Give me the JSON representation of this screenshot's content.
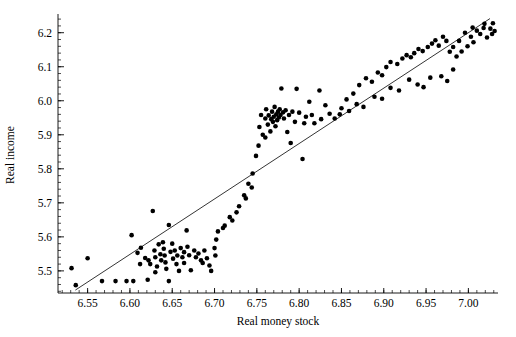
{
  "chart_data": {
    "type": "scatter",
    "title": "",
    "xlabel": "Real money stock",
    "ylabel": "Real income",
    "xlim": [
      6.515,
      7.035
    ],
    "ylim": [
      5.435,
      6.255
    ],
    "grid": false,
    "legend": null,
    "x_major_ticks": [
      6.55,
      6.6,
      6.65,
      6.7,
      6.75,
      6.8,
      6.85,
      6.9,
      6.95,
      7.0
    ],
    "x_major_tick_labels": [
      "6.55",
      "6.60",
      "6.65",
      "6.70",
      "6.75",
      "6.80",
      "6.85",
      "6.90",
      "6.95",
      "7.00"
    ],
    "x_minor_tick_step": 0.01,
    "y_major_ticks": [
      5.5,
      5.6,
      5.7,
      5.8,
      5.9,
      6.0,
      6.1,
      6.2
    ],
    "y_major_tick_labels": [
      "5.5",
      "5.6",
      "5.7",
      "5.8",
      "5.9",
      "6.0",
      "6.1",
      "6.2"
    ],
    "y_minor_tick_step": 0.02,
    "marker": "filled-circle",
    "marker_color": "#000000",
    "marker_size_px": 2.3,
    "series": [
      {
        "name": "observations",
        "points": [
          [
            6.531,
            5.508
          ],
          [
            6.536,
            5.458
          ],
          [
            6.55,
            5.537
          ],
          [
            6.567,
            5.47
          ],
          [
            6.602,
            5.605
          ],
          [
            6.604,
            5.47
          ],
          [
            6.609,
            5.553
          ],
          [
            6.612,
            5.52
          ],
          [
            6.621,
            5.474
          ],
          [
            6.622,
            5.531
          ],
          [
            6.624,
            5.52
          ],
          [
            6.627,
            5.676
          ],
          [
            6.629,
            5.56
          ],
          [
            6.63,
            5.54
          ],
          [
            6.632,
            5.513
          ],
          [
            6.634,
            5.578
          ],
          [
            6.636,
            5.549
          ],
          [
            6.637,
            5.531
          ],
          [
            6.639,
            5.584
          ],
          [
            6.64,
            5.565
          ],
          [
            6.641,
            5.545
          ],
          [
            6.642,
            5.525
          ],
          [
            6.643,
            5.506
          ],
          [
            6.646,
            5.635
          ],
          [
            6.648,
            5.556
          ],
          [
            6.65,
            5.58
          ],
          [
            6.651,
            5.536
          ],
          [
            6.653,
            5.56
          ],
          [
            6.655,
            5.52
          ],
          [
            6.656,
            5.545
          ],
          [
            6.658,
            5.5
          ],
          [
            6.66,
            5.567
          ],
          [
            6.662,
            5.54
          ],
          [
            6.664,
            5.555
          ],
          [
            6.667,
            5.619
          ],
          [
            6.668,
            5.571
          ],
          [
            6.67,
            5.546
          ],
          [
            6.672,
            5.502
          ],
          [
            6.676,
            5.56
          ],
          [
            6.678,
            5.54
          ],
          [
            6.681,
            5.551
          ],
          [
            6.684,
            5.531
          ],
          [
            6.688,
            5.56
          ],
          [
            6.691,
            5.537
          ],
          [
            6.696,
            5.5
          ],
          [
            6.7,
            5.567
          ],
          [
            6.701,
            5.545
          ],
          [
            6.704,
            5.616
          ],
          [
            6.712,
            5.633
          ],
          [
            6.721,
            5.648
          ],
          [
            6.729,
            5.69
          ],
          [
            6.737,
            5.713
          ],
          [
            6.744,
            5.745
          ],
          [
            6.749,
            5.838
          ],
          [
            6.753,
            5.923
          ],
          [
            6.755,
            5.958
          ],
          [
            6.757,
            5.9
          ],
          [
            6.76,
            5.948
          ],
          [
            6.761,
            5.975
          ],
          [
            6.763,
            5.93
          ],
          [
            6.764,
            5.957
          ],
          [
            6.766,
            5.91
          ],
          [
            6.767,
            5.946
          ],
          [
            6.768,
            5.968
          ],
          [
            6.769,
            5.938
          ],
          [
            6.77,
            5.953
          ],
          [
            6.771,
            5.982
          ],
          [
            6.772,
            5.925
          ],
          [
            6.773,
            5.96
          ],
          [
            6.774,
            5.943
          ],
          [
            6.775,
            5.968
          ],
          [
            6.776,
            5.951
          ],
          [
            6.777,
            5.975
          ],
          [
            6.778,
            5.958
          ],
          [
            6.779,
            6.036
          ],
          [
            6.781,
            5.966
          ],
          [
            6.782,
            5.948
          ],
          [
            6.784,
            5.972
          ],
          [
            6.786,
            5.908
          ],
          [
            6.788,
            5.958
          ],
          [
            6.79,
            5.876
          ],
          [
            6.792,
            5.968
          ],
          [
            6.795,
            5.938
          ],
          [
            6.797,
            6.035
          ],
          [
            6.8,
            5.965
          ],
          [
            6.804,
            5.829
          ],
          [
            6.808,
            5.953
          ],
          [
            6.812,
            5.997
          ],
          [
            6.818,
            5.934
          ],
          [
            6.824,
            6.03
          ],
          [
            6.831,
            5.987
          ],
          [
            6.842,
            5.948
          ],
          [
            6.848,
            5.96
          ],
          [
            6.856,
            6.004
          ],
          [
            6.864,
            6.021
          ],
          [
            6.871,
            6.046
          ],
          [
            6.879,
            6.066
          ],
          [
            6.886,
            6.056
          ],
          [
            6.893,
            6.083
          ],
          [
            6.898,
            6.075
          ],
          [
            6.903,
            6.099
          ],
          [
            6.908,
            6.114
          ],
          [
            6.916,
            6.108
          ],
          [
            6.922,
            6.124
          ],
          [
            6.927,
            6.134
          ],
          [
            6.932,
            6.128
          ],
          [
            6.936,
            6.14
          ],
          [
            6.941,
            6.152
          ],
          [
            6.946,
            6.146
          ],
          [
            6.952,
            6.158
          ],
          [
            6.957,
            6.168
          ],
          [
            6.961,
            6.178
          ],
          [
            6.965,
            6.162
          ],
          [
            6.97,
            6.188
          ],
          [
            6.974,
            6.176
          ],
          [
            6.978,
            6.144
          ],
          [
            6.982,
            6.158
          ],
          [
            6.986,
            6.13
          ],
          [
            6.989,
            6.176
          ],
          [
            6.992,
            6.145
          ],
          [
            6.996,
            6.2
          ],
          [
            6.999,
            6.16
          ],
          [
            7.003,
            6.188
          ],
          [
            7.006,
            6.172
          ],
          [
            7.01,
            6.206
          ],
          [
            7.014,
            6.196
          ],
          [
            7.018,
            6.214
          ],
          [
            7.022,
            6.186
          ],
          [
            7.026,
            6.212
          ],
          [
            7.029,
            6.228
          ],
          [
            6.982,
            6.092
          ],
          [
            6.975,
            6.058
          ],
          [
            6.968,
            6.072
          ],
          [
            6.955,
            6.068
          ],
          [
            6.947,
            6.04
          ],
          [
            6.94,
            6.048
          ],
          [
            6.93,
            6.062
          ],
          [
            6.918,
            6.03
          ],
          [
            6.908,
            6.038
          ],
          [
            6.898,
            6.006
          ],
          [
            6.889,
            6.012
          ],
          [
            6.876,
            5.982
          ],
          [
            6.868,
            5.99
          ],
          [
            6.859,
            5.97
          ],
          [
            6.85,
            5.978
          ],
          [
            6.836,
            5.962
          ],
          [
            6.826,
            5.946
          ],
          [
            6.815,
            5.958
          ],
          [
            6.806,
            5.934
          ],
          [
            6.76,
            5.892
          ],
          [
            6.752,
            5.868
          ],
          [
            6.745,
            5.786
          ],
          [
            6.74,
            5.756
          ],
          [
            6.735,
            5.722
          ],
          [
            6.726,
            5.672
          ],
          [
            6.718,
            5.658
          ],
          [
            6.71,
            5.626
          ],
          [
            6.702,
            5.592
          ],
          [
            6.694,
            5.516
          ],
          [
            6.686,
            5.523
          ],
          [
            6.664,
            5.523
          ],
          [
            6.646,
            5.47
          ],
          [
            6.63,
            5.496
          ],
          [
            6.618,
            5.538
          ],
          [
            6.613,
            5.568
          ],
          [
            6.596,
            5.47
          ],
          [
            6.583,
            5.47
          ],
          [
            7.031,
            6.205
          ],
          [
            7.028,
            6.196
          ],
          [
            7.019,
            6.226
          ],
          [
            7.005,
            6.215
          ]
        ]
      }
    ],
    "fit_line": {
      "name": "regression-line",
      "x_start": 6.5355,
      "y_start": 5.4435,
      "x_end": 7.0255,
      "y_end": 6.2415,
      "color": "#000000",
      "width_px": 0.8
    }
  },
  "axes": {
    "x_axis_title": "Real money stock",
    "y_axis_title": "Real income"
  }
}
